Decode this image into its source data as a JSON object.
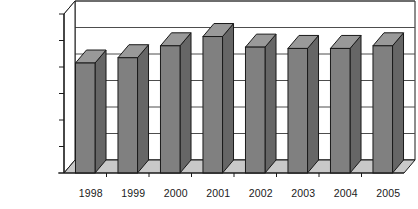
{
  "chart_data": {
    "type": "bar",
    "title": "",
    "subtitle": "",
    "xlabel": "",
    "ylabel": "",
    "categories": [
      "1998",
      "1999",
      "2000",
      "2001",
      "2002",
      "2003",
      "2004",
      "2005"
    ],
    "values": [
      830000,
      870000,
      960000,
      1030000,
      950000,
      940000,
      940000,
      960000
    ],
    "series": [
      {
        "name": "",
        "values": [
          830000,
          870000,
          960000,
          1030000,
          950000,
          940000,
          940000,
          960000
        ]
      }
    ],
    "ylim": [
      0,
      1200000
    ],
    "ytick_values": [
      0,
      200000,
      400000,
      600000,
      800000,
      1000000,
      1200000
    ],
    "ytick_labels": [
      "0",
      "200,000",
      "400,000",
      "600,000",
      "800,000",
      "1,000,000",
      "1,200,000"
    ],
    "xtick_labels": [
      "1998",
      "1999",
      "2000",
      "2001",
      "2002",
      "2003",
      "2004",
      "2005"
    ],
    "grid": true,
    "grid_axis": "y",
    "legend": false,
    "legend_position": "none",
    "style": "3d-column",
    "colors": {
      "bar_front": "#808080",
      "bar_top": "#999999",
      "bar_side": "#666666",
      "bar_outline": "#1a1a1a",
      "plot_back_wall": "#ffffff",
      "plot_floor": "#c8c8c8",
      "gridline": "#4d4d4d",
      "axis_line": "#1a1a1a",
      "text": "#1a1a1a",
      "background": "#ffffff"
    },
    "annotations": []
  }
}
